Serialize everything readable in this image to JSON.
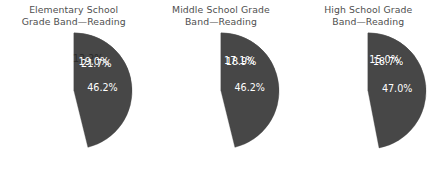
{
  "figure": {
    "background_color": "#ffffff",
    "panel_count": 3
  },
  "palette": {
    "slice_1": "#cfcfcf",
    "slice_2": "#9a9a9a",
    "slice_3": "#6e6e6e",
    "slice_4": "#474747",
    "title_text": "#4f4f4f",
    "label_dark": "#2b2b2b",
    "label_light": "#ffffff"
  },
  "charts": [
    {
      "title": "Elementary School\nGrade Band—Reading",
      "title_line_1": "Elementary School",
      "title_line_2": "Grade Band—Reading",
      "labels": [
        "13.2%",
        "21.7%",
        "19.0%",
        "46.2%"
      ]
    },
    {
      "title": "Middle School Grade\nBand—Reading",
      "title_line_1": "Middle School Grade",
      "title_line_2": "Band—Reading",
      "labels": [
        "17.9%",
        "18.9%",
        "17.1%",
        "46.2%"
      ]
    },
    {
      "title": "High School Grade\nBand—Reading",
      "title_line_1": "High School Grade",
      "title_line_2": "Band—Reading",
      "labels": [
        "19.4%",
        "18.7%",
        "15.0%",
        "47.0%"
      ]
    }
  ],
  "chart_data": [
    {
      "type": "pie",
      "title": "Elementary School Grade Band—Reading",
      "categories": [
        "Segment 1",
        "Segment 2",
        "Segment 3",
        "Segment 4"
      ],
      "values": [
        13.2,
        21.7,
        19.0,
        46.2
      ],
      "labels": [
        "13.2%",
        "21.7%",
        "19.0%",
        "46.2%"
      ],
      "colors": [
        "#cfcfcf",
        "#9a9a9a",
        "#6e6e6e",
        "#474747"
      ],
      "start_angle_deg": 0,
      "direction": "clockwise",
      "legend": "none",
      "xlabel": "",
      "ylabel": ""
    },
    {
      "type": "pie",
      "title": "Middle School Grade Band—Reading",
      "categories": [
        "Segment 1",
        "Segment 2",
        "Segment 3",
        "Segment 4"
      ],
      "values": [
        17.9,
        18.9,
        17.1,
        46.2
      ],
      "labels": [
        "17.9%",
        "18.9%",
        "17.1%",
        "46.2%"
      ],
      "colors": [
        "#cfcfcf",
        "#9a9a9a",
        "#6e6e6e",
        "#474747"
      ],
      "start_angle_deg": 0,
      "direction": "clockwise",
      "legend": "none",
      "xlabel": "",
      "ylabel": ""
    },
    {
      "type": "pie",
      "title": "High School Grade Band—Reading",
      "categories": [
        "Segment 1",
        "Segment 2",
        "Segment 3",
        "Segment 4"
      ],
      "values": [
        19.4,
        18.7,
        15.0,
        47.0
      ],
      "labels": [
        "19.4%",
        "18.7%",
        "15.0%",
        "47.0%"
      ],
      "colors": [
        "#cfcfcf",
        "#9a9a9a",
        "#6e6e6e",
        "#474747"
      ],
      "start_angle_deg": 0,
      "direction": "clockwise",
      "legend": "none",
      "xlabel": "",
      "ylabel": ""
    }
  ]
}
